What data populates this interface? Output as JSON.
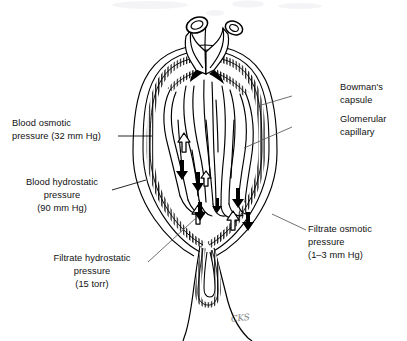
{
  "figure": {
    "type": "anatomical-diagram",
    "background_color": "#ffffff",
    "ink_color": "#000000"
  },
  "labels": {
    "blood_osmotic": "Blood osmotic\npressure (32 mm Hg)",
    "blood_hydrostatic": "Blood hydrostatic\npressure\n(90 mm Hg)",
    "filtrate_hydrostatic": "Filtrate hydrostatic\npressure\n(15 torr)",
    "bowmans_capsule": "Bowman's\ncapsule",
    "glomerular_capillary": "Glomerular\ncapillary",
    "filtrate_osmotic": "Filtrate osmotic\npressure\n(1–3 mm Hg)"
  },
  "pressures": [
    {
      "name": "Blood osmotic pressure",
      "value": "32",
      "unit": "mm Hg",
      "direction": "inward"
    },
    {
      "name": "Blood hydrostatic pressure",
      "value": "90",
      "unit": "mm Hg",
      "direction": "outward"
    },
    {
      "name": "Filtrate hydrostatic pressure",
      "value": "15",
      "unit": "torr",
      "direction": "inward"
    },
    {
      "name": "Filtrate osmotic pressure",
      "value": "1–3",
      "unit": "mm Hg",
      "direction": "outward"
    }
  ],
  "structures": [
    {
      "name": "afferent-arteriole",
      "position": "top-left"
    },
    {
      "name": "efferent-arteriole",
      "position": "top-right"
    },
    {
      "name": "glomerular-capillary-tuft",
      "position": "center"
    },
    {
      "name": "bowmans-capsule",
      "position": "surrounding"
    },
    {
      "name": "proximal-tubule",
      "position": "bottom"
    }
  ],
  "arrows": {
    "filled_down_label": "black filled arrow (outward filtration force)",
    "hollow_up_label": "hollow outlined arrow (inward osmotic force)"
  },
  "signature": "CKS"
}
